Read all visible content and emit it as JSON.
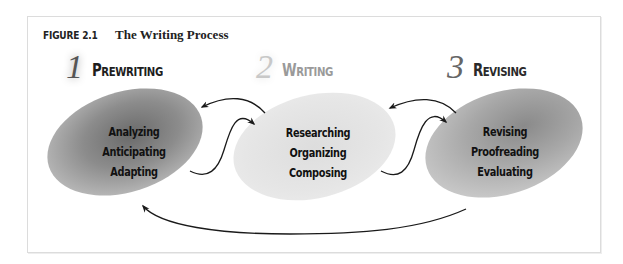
{
  "figure": {
    "label": "FIGURE 2.1",
    "title": "The Writing Process"
  },
  "stages": [
    {
      "number": "1",
      "name_first": "P",
      "name_rest": "REWRITING",
      "name": "Prewriting",
      "items": [
        "Analyzing",
        "Anticipating",
        "Adapting"
      ],
      "emphasis": "dark"
    },
    {
      "number": "2",
      "name_first": "W",
      "name_rest": "RITING",
      "name": "Writing",
      "items": [
        "Researching",
        "Organizing",
        "Composing"
      ],
      "emphasis": "light"
    },
    {
      "number": "3",
      "name_first": "R",
      "name_rest": "EVISING",
      "name": "Revising",
      "items": [
        "Revising",
        "Proofreading",
        "Evaluating"
      ],
      "emphasis": "medium"
    }
  ],
  "connectors": [
    {
      "from": "Writing",
      "to": "Prewriting",
      "type": "curved-arrow"
    },
    {
      "from": "Prewriting",
      "to": "Writing",
      "type": "s-curve-arrow"
    },
    {
      "from": "Revising",
      "to": "Writing",
      "type": "curved-arrow"
    },
    {
      "from": "Writing",
      "to": "Revising",
      "type": "s-curve-arrow"
    },
    {
      "from": "Revising",
      "to": "Prewriting",
      "type": "long-return-arrow"
    }
  ],
  "colors": {
    "frame_border": "#dcdcdc",
    "arrow": "#1a1a1a",
    "text": "#111111",
    "stage2_heading": "#9a9a9a"
  }
}
